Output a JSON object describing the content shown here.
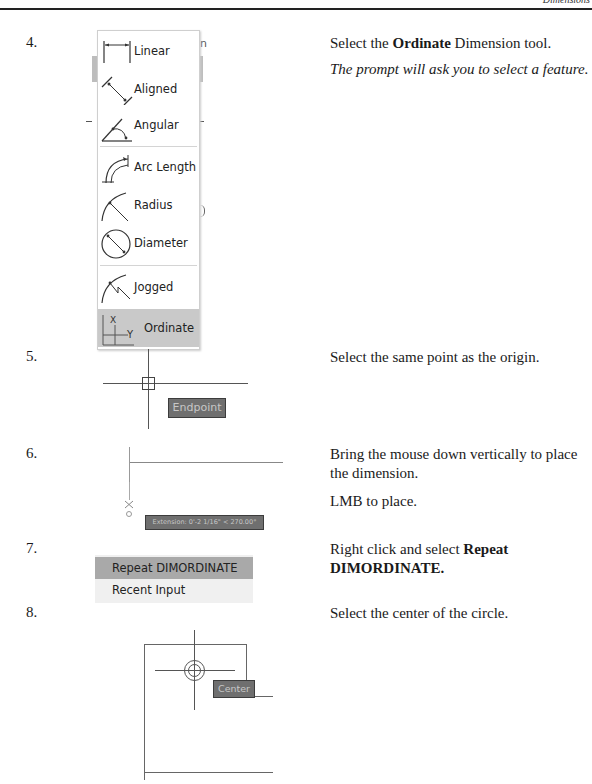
{
  "header": {
    "running_head": "Dimensions"
  },
  "steps": [
    {
      "number": "4.",
      "instruction_parts": {
        "before": "Select the ",
        "bold": "Ordinate",
        "after": " Dimension tool."
      },
      "note": "The prompt will ask you to select a feature."
    },
    {
      "number": "5.",
      "instruction": "Select the same point as the origin."
    },
    {
      "number": "6.",
      "instruction": "Bring the mouse down vertically to place the dimension.",
      "instruction2": "LMB to place."
    },
    {
      "number": "7.",
      "instruction_parts": {
        "before": "Right click and select ",
        "bold": "Repeat DIMORDINATE.",
        "after": ""
      }
    },
    {
      "number": "8.",
      "instruction": "Select the center of the circle."
    }
  ],
  "dimension_menu": {
    "items": [
      {
        "label": "Linear",
        "icon": "linear-dimension-icon"
      },
      {
        "label": "Aligned",
        "icon": "aligned-dimension-icon"
      },
      {
        "label": "Angular",
        "icon": "angular-dimension-icon"
      },
      {
        "label": "Arc Length",
        "icon": "arc-length-icon"
      },
      {
        "label": "Radius",
        "icon": "radius-icon"
      },
      {
        "label": "Diameter",
        "icon": "diameter-icon"
      },
      {
        "label": "Jogged",
        "icon": "jogged-icon"
      },
      {
        "label": "Ordinate",
        "icon": "ordinate-icon",
        "selected": true
      }
    ],
    "ordinate_icon_letters": {
      "x": "X",
      "y": "Y"
    }
  },
  "step5_tooltip": "Endpoint",
  "step6_tooltip": "Extension: 0'-2 1/16\" < 270.00°",
  "context_menu": {
    "items": [
      {
        "label": "Repeat DIMORDINATE",
        "highlighted": true
      },
      {
        "label": "Recent Input",
        "highlighted": false
      }
    ]
  },
  "step8_tooltip": "Center"
}
